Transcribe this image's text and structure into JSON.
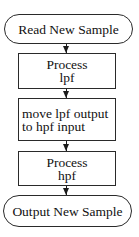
{
  "flowchart": {
    "nodes": [
      {
        "id": "start",
        "shape": "terminator",
        "lines": [
          "Read New Sample"
        ]
      },
      {
        "id": "process-lpf",
        "shape": "process",
        "lines": [
          "Process",
          "lpf"
        ]
      },
      {
        "id": "move-output",
        "shape": "process",
        "lines": [
          "move lpf output",
          "to hpf input"
        ]
      },
      {
        "id": "process-hpf",
        "shape": "process",
        "lines": [
          "Process",
          "hpf"
        ]
      },
      {
        "id": "end",
        "shape": "terminator",
        "lines": [
          "Output New Sample"
        ]
      }
    ],
    "edges": [
      {
        "from": "start",
        "to": "process-lpf"
      },
      {
        "from": "process-lpf",
        "to": "move-output"
      },
      {
        "from": "move-output",
        "to": "process-hpf"
      },
      {
        "from": "process-hpf",
        "to": "end"
      }
    ],
    "colors": {
      "stroke": "#2a2a2a",
      "fill": "#ffffff",
      "text": "#111111"
    }
  }
}
